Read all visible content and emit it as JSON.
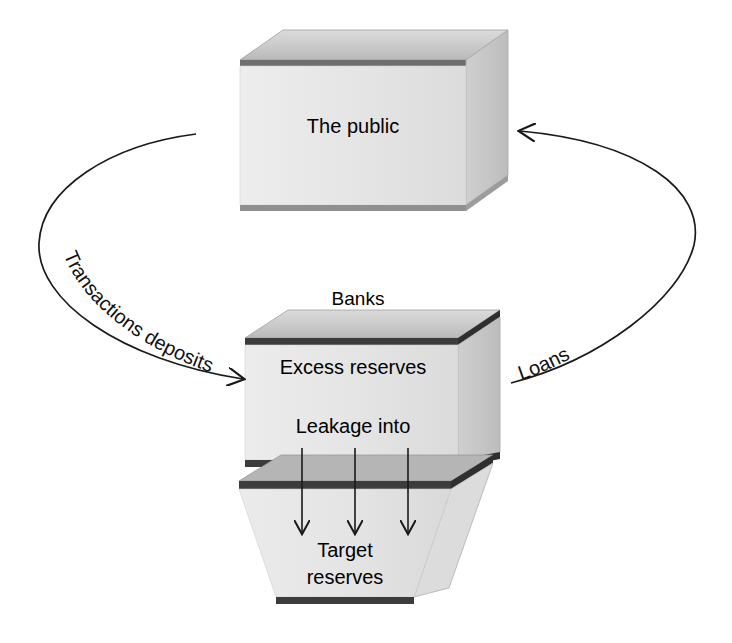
{
  "diagram": {
    "nodes": {
      "public": {
        "label": "The public",
        "shape": "3d-box"
      },
      "banks": {
        "title": "Banks",
        "label_top": "Excess reserves",
        "label_bottom": "Leakage into",
        "shape": "3d-box"
      },
      "target": {
        "label_line1": "Target",
        "label_line2": "reserves",
        "shape": "3d-funnel"
      }
    },
    "edges": {
      "deposits": {
        "label": "Transactions deposits",
        "from": "public",
        "to": "banks",
        "direction": "down-right"
      },
      "loans": {
        "label": "Loans",
        "from": "banks",
        "to": "public",
        "direction": "up-right"
      },
      "leakage": {
        "label": "",
        "from": "banks",
        "to": "target",
        "arrow_count": 3
      }
    },
    "colors": {
      "box_front": "#e8e8e8",
      "box_top": "#c9c9c9",
      "box_side": "#d2d2d2",
      "box_edge_dark": "#4a4a4a",
      "stroke": "#1a1a1a",
      "text": "#000000",
      "background": "#ffffff"
    }
  }
}
